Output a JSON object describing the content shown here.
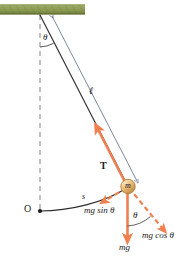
{
  "figure": {
    "colors": {
      "ceiling": "#8c9b54",
      "ceiling_dark": "#6f7d3c",
      "ceiling_light": "#b6c086",
      "force_orange": "#f08050",
      "string": "#3a3a3a",
      "dimension_line": "#5a6a82",
      "bob_fill": "#e8b878",
      "bob_stroke": "#b07c32",
      "text": "#1a1a1a"
    },
    "labels": {
      "pivot_angle": "θ",
      "length": "ℓ",
      "tension": "T",
      "bob_mass": "m",
      "origin": "O",
      "arc_length": "s",
      "tangential_force": "mg sin θ",
      "radial_force": "mg cos θ",
      "weight": "mg",
      "bob_angle": "θ"
    },
    "elements": {
      "ceiling": "hatched-ceiling-support",
      "vertical_dashed": "equilibrium-reference-line",
      "string": "pendulum-string",
      "length_dimension": "length-dimension-arrow",
      "arc": "swing-arc-path",
      "bob": "pendulum-bob",
      "tension_vector": "tension-force-arrow",
      "tangential_vector": "tangential-component-arrow",
      "radial_vector": "radial-component-arrow",
      "weight_vector": "weight-force-arrow",
      "angle_arc_top": "pivot-angle-arc",
      "angle_arc_bottom": "bob-angle-arc"
    }
  }
}
